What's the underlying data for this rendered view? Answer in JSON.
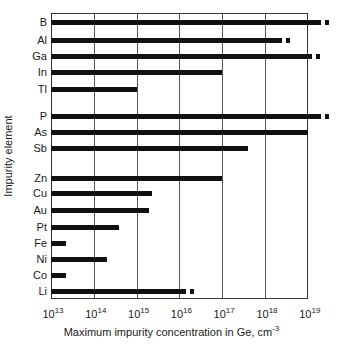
{
  "chart_data": {
    "type": "bar",
    "orientation": "horizontal",
    "title": "",
    "xlabel": "Maximum impurity concentration in Ge, cm",
    "xlabel_exponent": "-3",
    "ylabel": "Impurity element",
    "xscale": "log",
    "xlim": [
      10000000000000.0,
      1e+19
    ],
    "x_ticks": [
      {
        "base": "10",
        "exp": "13"
      },
      {
        "base": "10",
        "exp": "14"
      },
      {
        "base": "10",
        "exp": "15"
      },
      {
        "base": "10",
        "exp": "16"
      },
      {
        "base": "10",
        "exp": "17"
      },
      {
        "base": "10",
        "exp": "18"
      },
      {
        "base": "10",
        "exp": "19"
      }
    ],
    "grid": true,
    "legend": null,
    "groups": [
      {
        "name": "Group III",
        "categories": [
          "B",
          "Al",
          "Ga",
          "In",
          "Tl"
        ]
      },
      {
        "name": "Group V",
        "categories": [
          "P",
          "As",
          "Sb"
        ]
      },
      {
        "name": "Other",
        "categories": [
          "Zn",
          "Cu",
          "Au",
          "Pt",
          "Fe",
          "Ni",
          "Co",
          "Li"
        ]
      }
    ],
    "categories": [
      "B",
      "Al",
      "Ga",
      "In",
      "Tl",
      "P",
      "As",
      "Sb",
      "Zn",
      "Cu",
      "Au",
      "Pt",
      "Fe",
      "Ni",
      "Co",
      "Li"
    ],
    "values_log10": [
      19.3,
      18.4,
      19.1,
      17.0,
      15.0,
      19.3,
      19.0,
      17.6,
      17.0,
      15.35,
      15.3,
      14.6,
      13.35,
      14.3,
      13.35,
      16.15
    ],
    "values": [
      2e+19,
      2.5e+18,
      1.3e+19,
      1e+17,
      1000000000000000.0,
      2e+19,
      1e+19,
      4e+17,
      1e+17,
      2200000000000000.0,
      2000000000000000.0,
      400000000000000.0,
      22000000000000.0,
      200000000000000.0,
      22000000000000.0,
      1.4e+16
    ],
    "extended_marker": [
      true,
      true,
      true,
      false,
      false,
      true,
      false,
      false,
      false,
      false,
      false,
      false,
      false,
      false,
      false,
      true
    ],
    "annotations": "Small square markers after B, Al, Ga, P, Li bars indicate values extending beyond bar end"
  },
  "colors": {
    "bar": "#111111",
    "grid": "#555555",
    "background": "#ffffff"
  }
}
